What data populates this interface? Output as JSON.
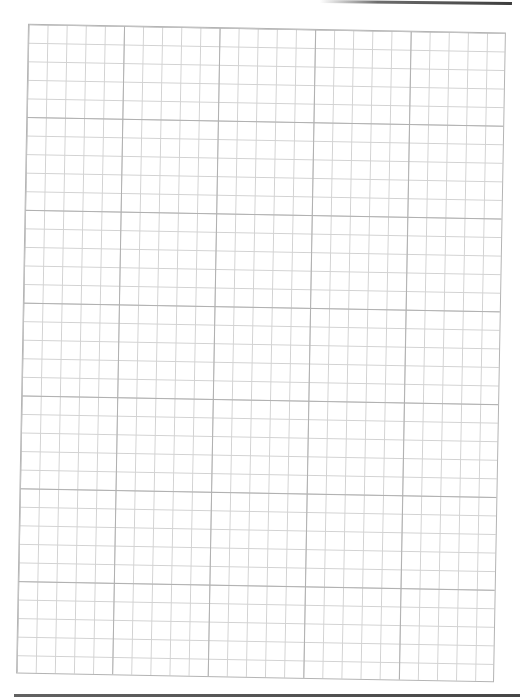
{
  "document": {
    "type": "graph-paper",
    "grid": {
      "major_columns": 5,
      "major_rows": 7,
      "minor_per_major": 5,
      "minor_columns": 25,
      "minor_rows": 35,
      "major_line_color": "#b0b0b0",
      "minor_line_color": "#d2d2d2",
      "border_color": "#b4b4b4",
      "background_color": "#ffffff"
    },
    "scan_artifacts": {
      "top_edge_line_color": "#3c3c3c",
      "bottom_edge_line_color": "#464646"
    },
    "text": []
  }
}
